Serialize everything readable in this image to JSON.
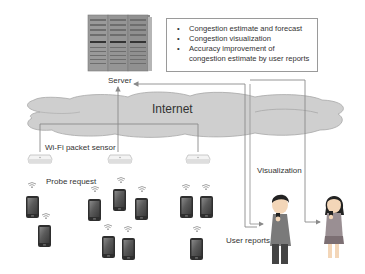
{
  "server": {
    "label": "Server",
    "icon": "server-rack-icon"
  },
  "info_box": {
    "bullet": "•",
    "items": [
      "Congestion estimate and forecast",
      "Congestion visualization",
      "Accuracy improvement of",
      "congestion estimate by user reports"
    ]
  },
  "network": {
    "label": "Internet",
    "icon": "cloud-icon"
  },
  "sensors": {
    "label": "Wi-Fi packet sensor",
    "count": 3,
    "icon": "wifi-sensor-icon"
  },
  "devices": {
    "label": "Probe request",
    "count": 12,
    "icon": "smartphone-icon",
    "signal_icon": "wifi-signal-icon"
  },
  "users": {
    "reports_label": "User reports",
    "visualization_label": "Visualization",
    "man_icon": "man-with-phone-icon",
    "woman_icon": "woman-with-phone-icon"
  },
  "colors": {
    "cloud_fill": "#cfcfcf",
    "cloud_stroke": "#a8a8a8",
    "line": "#8a8a8a",
    "text": "#333333",
    "phone_body": "#2e2e2e",
    "server_body": "#8c8c8c"
  }
}
